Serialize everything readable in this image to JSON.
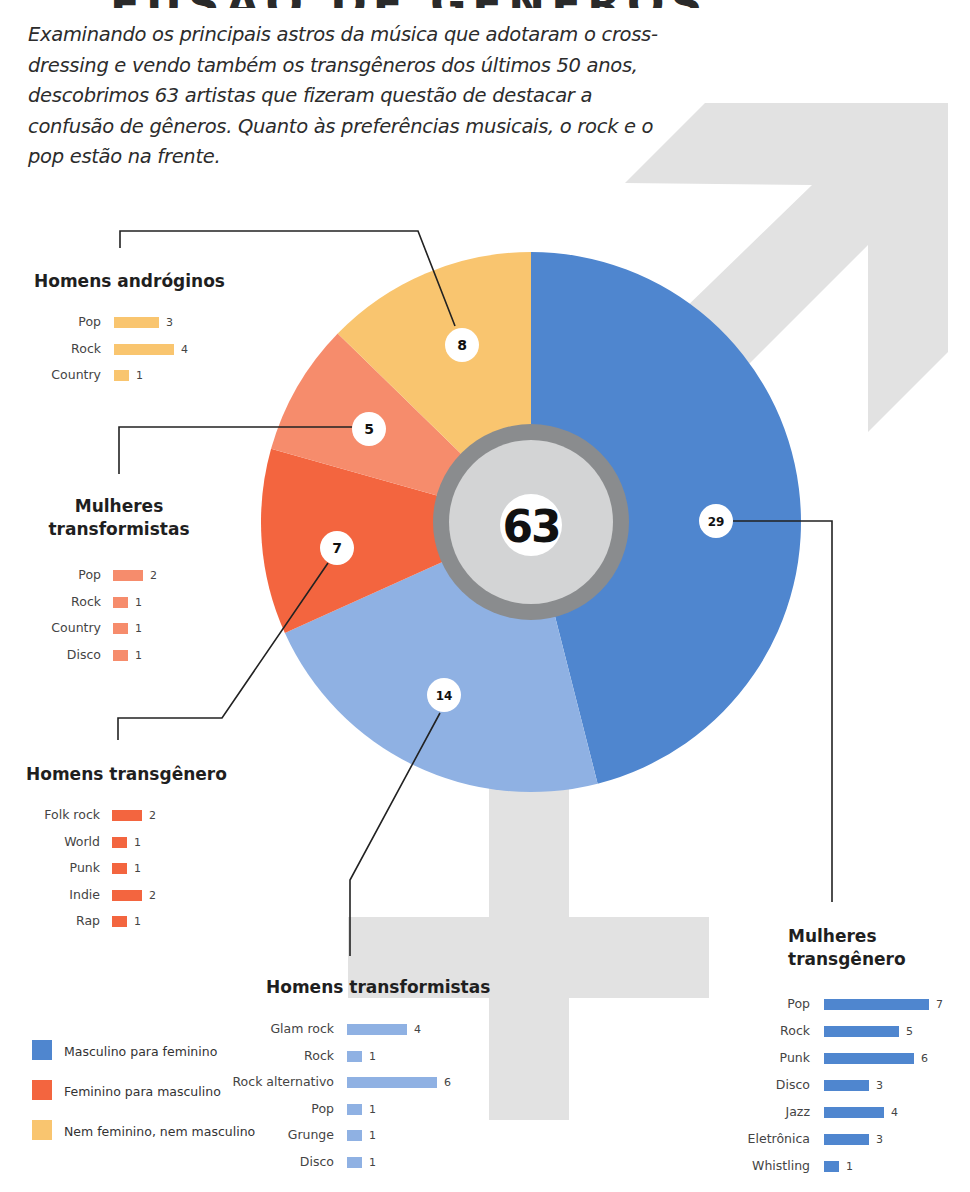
{
  "header": {
    "title_fragment": "FUSÃO DE GÊNEROS",
    "intro": "Examinando os principais astros da música que adotaram o cross-dressing e vendo também os transgêneros dos últimos 50 anos, descobrimos 63 artistas que fizeram questão de destacar a confusão de gêneros. Quanto às preferências musicais, o rock e o pop estão na frente."
  },
  "colors": {
    "masc_para_fem": "#4f86cf",
    "masc_para_fem_light": "#8fb1e3",
    "fem_para_masc": "#f3653f",
    "fem_para_masc_light": "#f68c6c",
    "nem_nem": "#f9c56f",
    "background_symbol": "#e2e2e2",
    "center_ring": "#8a8c8e",
    "center_fill": "#d3d4d5"
  },
  "chart_data": {
    "type": "pie",
    "title": "",
    "total": 63,
    "total_label": "63",
    "start_angle": "12 o'clock, clockwise",
    "slices": [
      {
        "name": "Mulheres transgênero",
        "value": 29,
        "label": "29",
        "color": "#4f86cf",
        "category": "Masculino para feminino"
      },
      {
        "name": "Homens transformistas",
        "value": 14,
        "label": "14",
        "color": "#8fb1e3",
        "category": "Masculino para feminino"
      },
      {
        "name": "Homens transgênero",
        "value": 7,
        "label": "7",
        "color": "#f3653f",
        "category": "Feminino para masculino"
      },
      {
        "name": "Mulheres transformistas",
        "value": 5,
        "label": "5",
        "color": "#f68c6c",
        "category": "Feminino para masculino"
      },
      {
        "name": "Homens andróginos",
        "value": 8,
        "label": "8",
        "color": "#f9c56f",
        "category": "Nem feminino, nem masculino"
      }
    ],
    "legend": [
      {
        "label": "Masculino para feminino",
        "color": "#4f86cf"
      },
      {
        "label": "Feminino para masculino",
        "color": "#f3653f"
      },
      {
        "label": "Nem feminino, nem masculino",
        "color": "#f9c56f"
      }
    ],
    "breakdowns": [
      {
        "title": "Homens andróginos",
        "color": "#f9c56f",
        "items": [
          {
            "label": "Pop",
            "value": 3
          },
          {
            "label": "Rock",
            "value": 4
          },
          {
            "label": "Country",
            "value": 1
          }
        ]
      },
      {
        "title": "Mulheres transformistas",
        "color": "#f68c6c",
        "items": [
          {
            "label": "Pop",
            "value": 2
          },
          {
            "label": "Rock",
            "value": 1
          },
          {
            "label": "Country",
            "value": 1
          },
          {
            "label": "Disco",
            "value": 1
          }
        ]
      },
      {
        "title": "Homens transgênero",
        "color": "#f3653f",
        "items": [
          {
            "label": "Folk rock",
            "value": 2
          },
          {
            "label": "World",
            "value": 1
          },
          {
            "label": "Punk",
            "value": 1
          },
          {
            "label": "Indie",
            "value": 2
          },
          {
            "label": "Rap",
            "value": 1
          }
        ]
      },
      {
        "title": "Homens transformistas",
        "color": "#8fb1e3",
        "items": [
          {
            "label": "Glam rock",
            "value": 4
          },
          {
            "label": "Rock",
            "value": 1
          },
          {
            "label": "Rock alternativo",
            "value": 6
          },
          {
            "label": "Pop",
            "value": 1
          },
          {
            "label": "Grunge",
            "value": 1
          },
          {
            "label": "Disco",
            "value": 1
          }
        ]
      },
      {
        "title": "Mulheres transgênero",
        "color": "#4f86cf",
        "items": [
          {
            "label": "Pop",
            "value": 7
          },
          {
            "label": "Rock",
            "value": 5
          },
          {
            "label": "Punk",
            "value": 6
          },
          {
            "label": "Disco",
            "value": 3
          },
          {
            "label": "Jazz",
            "value": 4
          },
          {
            "label": "Eletrônica",
            "value": 3
          },
          {
            "label": "Whistling",
            "value": 1
          }
        ]
      }
    ]
  }
}
